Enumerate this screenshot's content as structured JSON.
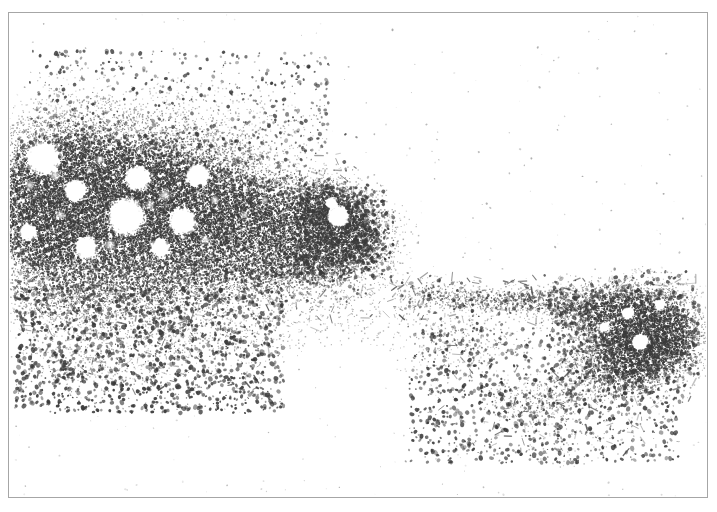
{
  "figure": {
    "kind": "micrograph-plate",
    "caption": "",
    "background_color": "#ffffff",
    "frame_color": "#a6a6a6",
    "stain_color": "#3a3a3a",
    "width": 717,
    "height": 512
  },
  "image_content": {
    "description": "Grayscale halftone micrograph of stained tissue spread",
    "regions": [
      {
        "name": "dense-tissue-mass-left",
        "x": 10,
        "y": 120,
        "w": 330,
        "h": 140
      },
      {
        "name": "tapering-tissue-band-center",
        "x": 230,
        "y": 150,
        "w": 180,
        "h": 130
      },
      {
        "name": "dark-nodule-center",
        "x": 300,
        "y": 180,
        "w": 70,
        "h": 70
      },
      {
        "name": "tissue-wedge-right",
        "x": 560,
        "y": 270,
        "w": 120,
        "h": 110
      },
      {
        "name": "filament-bridge",
        "x": 400,
        "y": 270,
        "w": 170,
        "h": 40
      },
      {
        "name": "scattered-debris-lower-left",
        "x": 10,
        "y": 290,
        "w": 260,
        "h": 110
      },
      {
        "name": "scattered-debris-lower-right",
        "x": 420,
        "y": 340,
        "w": 230,
        "h": 110
      },
      {
        "name": "sparse-speckle-upper",
        "x": 30,
        "y": 40,
        "w": 290,
        "h": 90
      }
    ],
    "vacuoles": [
      {
        "cx": 43,
        "cy": 158,
        "r": 13
      },
      {
        "cx": 75,
        "cy": 190,
        "r": 9
      },
      {
        "cx": 137,
        "cy": 178,
        "r": 10
      },
      {
        "cx": 197,
        "cy": 175,
        "r": 9
      },
      {
        "cx": 126,
        "cy": 216,
        "r": 15
      },
      {
        "cx": 182,
        "cy": 221,
        "r": 11
      },
      {
        "cx": 86,
        "cy": 247,
        "r": 9
      },
      {
        "cx": 28,
        "cy": 232,
        "r": 7
      },
      {
        "cx": 160,
        "cy": 247,
        "r": 7
      },
      {
        "cx": 338,
        "cy": 216,
        "r": 9
      },
      {
        "cx": 331,
        "cy": 203,
        "r": 5
      },
      {
        "cx": 640,
        "cy": 342,
        "r": 7
      },
      {
        "cx": 627,
        "cy": 313,
        "r": 5
      },
      {
        "cx": 659,
        "cy": 304,
        "r": 4
      },
      {
        "cx": 604,
        "cy": 327,
        "r": 4
      }
    ],
    "seed": 20240817
  }
}
